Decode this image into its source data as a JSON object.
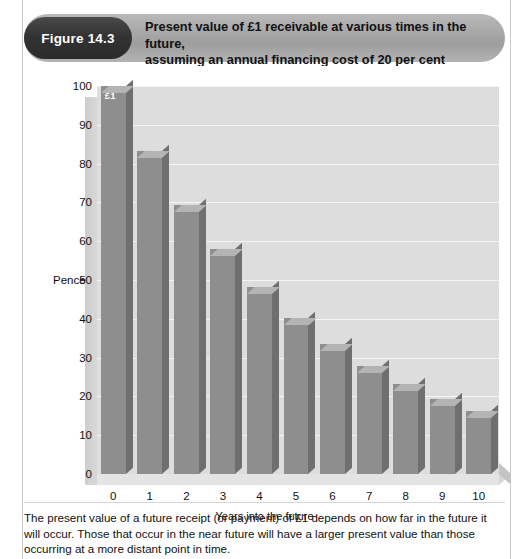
{
  "figure": {
    "badge": "Figure 14.3",
    "title_line1": "Present value of £1 receivable at various times in the future,",
    "title_line2": "assuming an annual financing cost of 20 per cent",
    "caption": "The present value of a future receipt (or payment) of £1 depends on how far in the future it will occur. Those that occur in the near future will have a larger present value than those occurring at a more distant point in time."
  },
  "colors": {
    "badge_bg": "#2f2f2f",
    "banner_bg": "#a8a8a8",
    "plot_bg": "#dddddd",
    "bar_front": "#8e8e8e",
    "bar_top": "#b4b4b4",
    "bar_side": "#6f6f6f",
    "gridline": "#f4f4f4",
    "text": "#111111"
  },
  "chart_data": {
    "type": "bar",
    "title": "Present value of £1 receivable at various times in the future, assuming an annual financing cost of 20 per cent",
    "xlabel": "Years into the future",
    "ylabel": "Pence",
    "categories": [
      "0",
      "1",
      "2",
      "3",
      "4",
      "5",
      "6",
      "7",
      "8",
      "9",
      "10"
    ],
    "values": [
      100,
      83.3,
      69.4,
      57.9,
      48.2,
      40.2,
      33.5,
      27.9,
      23.3,
      19.4,
      16.2
    ],
    "ylim": [
      0,
      100
    ],
    "yticks": [
      0,
      10,
      20,
      30,
      40,
      50,
      60,
      70,
      80,
      90,
      100
    ],
    "ytick_labels": [
      "0",
      "10",
      "20",
      "30",
      "40",
      "50",
      "60",
      "70",
      "80",
      "90",
      "100"
    ],
    "grid": true,
    "legend": false,
    "annotations": [
      {
        "category": "0",
        "text": "£1"
      }
    ]
  }
}
